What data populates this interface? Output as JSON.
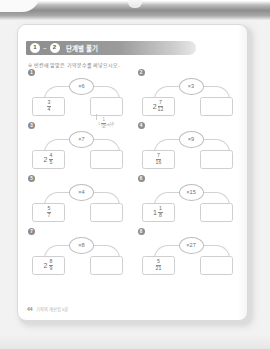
{
  "page": {
    "title_steps": [
      "1",
      "2"
    ],
    "step_separator": "~",
    "title": "단계별 풀기",
    "instruction_marker": "※",
    "instruction": "빈칸에 알맞은 기약분수를 써넣으시오.",
    "footer_page": "44",
    "footer_text": "기적의 계산법 6권"
  },
  "problems": [
    {
      "number": "1",
      "whole": "",
      "numerator": "3",
      "denominator": "4",
      "operator": "×6",
      "answer": ""
    },
    {
      "number": "2",
      "whole": "2",
      "numerator": "7",
      "denominator": "12",
      "operator": "×3",
      "answer": ""
    },
    {
      "number": "3",
      "whole": "2",
      "numerator": "4",
      "denominator": "5",
      "operator": "×7",
      "answer": ""
    },
    {
      "number": "4",
      "whole": "",
      "numerator": "7",
      "denominator": "16",
      "operator": "×9",
      "answer": ""
    },
    {
      "number": "5",
      "whole": "",
      "numerator": "5",
      "denominator": "7",
      "operator": "×4",
      "answer": ""
    },
    {
      "number": "6",
      "whole": "1",
      "numerator": "1",
      "denominator": "8",
      "operator": "×15",
      "answer": ""
    },
    {
      "number": "7",
      "whole": "2",
      "numerator": "8",
      "denominator": "9",
      "operator": "×8",
      "answer": ""
    },
    {
      "number": "8",
      "whole": "",
      "numerator": "5",
      "denominator": "21",
      "operator": "×27",
      "answer": ""
    }
  ],
  "note": {
    "whole": "1",
    "numerator": "1",
    "denominator": "2",
    "suffix": "=18",
    "caption": "약분하기"
  },
  "colors": {
    "page_background": "#f2f2f2",
    "sheet": "#ffffff",
    "title_bar": "#8e8e8e",
    "ink": "#6b6b6b",
    "rule": "#cfcfcf"
  }
}
